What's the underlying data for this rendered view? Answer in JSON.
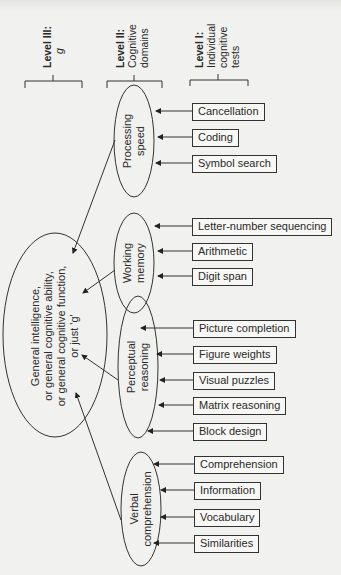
{
  "headers": {
    "level3": {
      "title": "Level III:",
      "subtitle": "g"
    },
    "level2": {
      "title": "Level II:",
      "line1": "Cognitive",
      "line2": "domains"
    },
    "level1": {
      "title": "Level I:",
      "line1": "Individual",
      "line2": "cognitive",
      "line3": "tests"
    }
  },
  "g_node": {
    "line1": "General intelligence,",
    "line2": "or general cognitive ability,",
    "line3": "or general cognitive function,",
    "line4": "or just 'g'"
  },
  "domains": [
    {
      "line1": "Processing",
      "line2": "speed",
      "tests": [
        "Cancellation",
        "Coding",
        "Symbol search"
      ]
    },
    {
      "line1": "Working",
      "line2": "memory",
      "tests": [
        "Letter-number sequencing",
        "Arithmetic",
        "Digit span"
      ]
    },
    {
      "line1": "Perceptual",
      "line2": "reasoning",
      "tests": [
        "Picture completion",
        "Figure weights",
        "Visual puzzles",
        "Matrix reasoning",
        "Block design"
      ]
    },
    {
      "line1": "Verbal",
      "line2": "comprehension",
      "tests": [
        "Comprehension",
        "Information",
        "Vocabulary",
        "Similarities"
      ]
    }
  ]
}
